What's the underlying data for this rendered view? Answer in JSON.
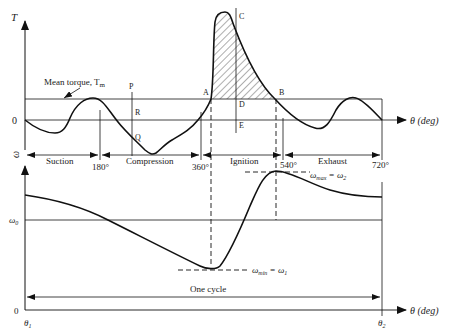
{
  "torque_plot": {
    "y_axis_label": "T",
    "zero_label": "0",
    "x_axis_label": "θ (deg)",
    "mean_torque_label": "Mean torque, T",
    "mean_torque_subscript": "m",
    "points": {
      "P": "P",
      "R": "R",
      "Q": "Q",
      "A": "A",
      "B": "B",
      "C": "C",
      "D": "D",
      "E": "E"
    },
    "strokes": [
      {
        "label": "Suction",
        "from": "0°",
        "to": "180°"
      },
      {
        "label": "Compression",
        "from": "180°",
        "to": "360°"
      },
      {
        "label": "Ignition",
        "from": "360°",
        "to": "540°"
      },
      {
        "label": "Exhaust",
        "from": "540°",
        "to": "720°"
      }
    ],
    "ticks": {
      "t180": "180°",
      "t360": "360°",
      "t540": "540°",
      "t720": "720°"
    },
    "stroke_row_axis_label": "ω"
  },
  "speed_plot": {
    "y_axis_label": "ω",
    "omega0_label": "ω",
    "omega0_subscript": "0",
    "zero_label": "0",
    "x_axis_label": "θ (deg)",
    "omega_min_label": "ω",
    "omega_min_sub": "min",
    "omega_min_eq": " = ω",
    "omega_min_eq_sub": "1",
    "omega_max_label": "ω",
    "omega_max_sub": "max",
    "omega_max_eq": " = ω",
    "omega_max_eq_sub": "2",
    "one_cycle_label": "One cycle",
    "theta1_label": "θ",
    "theta1_sub": "1",
    "theta2_label": "θ",
    "theta2_sub": "2"
  }
}
